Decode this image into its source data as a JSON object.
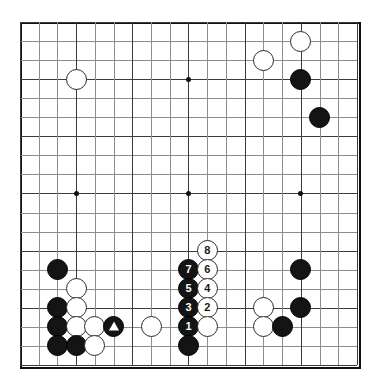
{
  "diagram": {
    "type": "go-board-diagram",
    "board_size": 19,
    "board": {
      "origin_x": 20,
      "origin_y": 22,
      "cell_w": 18.72,
      "cell_h": 19.05,
      "line_color": "#8d8d8d",
      "border_color": "#111111",
      "background_color": "#ffffff"
    },
    "star_points": [
      {
        "col": 3,
        "row": 3
      },
      {
        "col": 9,
        "row": 3
      },
      {
        "col": 15,
        "row": 3
      },
      {
        "col": 3,
        "row": 9
      },
      {
        "col": 9,
        "row": 9
      },
      {
        "col": 15,
        "row": 9
      },
      {
        "col": 3,
        "row": 15
      },
      {
        "col": 9,
        "row": 15
      },
      {
        "col": 15,
        "row": 15
      }
    ],
    "stones": [
      {
        "id": "w-c3-r1",
        "color": "white",
        "col": 3,
        "row": 3,
        "label": "",
        "marker": "none"
      },
      {
        "id": "w-c15-r1",
        "color": "white",
        "col": 15,
        "row": 1,
        "label": "",
        "marker": "none"
      },
      {
        "id": "w-c13-r2",
        "color": "white",
        "col": 13,
        "row": 2,
        "label": "",
        "marker": "none"
      },
      {
        "id": "b-c15-r3",
        "color": "black",
        "col": 15,
        "row": 3,
        "label": "",
        "marker": "none"
      },
      {
        "id": "b-c16-r5",
        "color": "black",
        "col": 16,
        "row": 5,
        "label": "",
        "marker": "none"
      },
      {
        "id": "w-8",
        "color": "white",
        "col": 10,
        "row": 12,
        "label": "8",
        "marker": "number"
      },
      {
        "id": "b-7",
        "color": "black",
        "col": 9,
        "row": 13,
        "label": "7",
        "marker": "number"
      },
      {
        "id": "w-6",
        "color": "white",
        "col": 10,
        "row": 13,
        "label": "6",
        "marker": "number"
      },
      {
        "id": "b-5",
        "color": "black",
        "col": 9,
        "row": 14,
        "label": "5",
        "marker": "number"
      },
      {
        "id": "w-4",
        "color": "white",
        "col": 10,
        "row": 14,
        "label": "4",
        "marker": "number"
      },
      {
        "id": "b-3",
        "color": "black",
        "col": 9,
        "row": 15,
        "label": "3",
        "marker": "number"
      },
      {
        "id": "w-2",
        "color": "white",
        "col": 10,
        "row": 15,
        "label": "2",
        "marker": "number"
      },
      {
        "id": "b-1",
        "color": "black",
        "col": 9,
        "row": 16,
        "label": "1",
        "marker": "number"
      },
      {
        "id": "w-c10-r16",
        "color": "white",
        "col": 10,
        "row": 16,
        "label": "",
        "marker": "none"
      },
      {
        "id": "b-c9-r17",
        "color": "black",
        "col": 9,
        "row": 17,
        "label": "",
        "marker": "none"
      },
      {
        "id": "b-c2-r13",
        "color": "black",
        "col": 2,
        "row": 13,
        "label": "",
        "marker": "none"
      },
      {
        "id": "w-c3-r14",
        "color": "white",
        "col": 3,
        "row": 14,
        "label": "",
        "marker": "none"
      },
      {
        "id": "b-c2-r15",
        "color": "black",
        "col": 2,
        "row": 15,
        "label": "",
        "marker": "none"
      },
      {
        "id": "w-c3-r15",
        "color": "white",
        "col": 3,
        "row": 15,
        "label": "",
        "marker": "none"
      },
      {
        "id": "b-c2-r16",
        "color": "black",
        "col": 2,
        "row": 16,
        "label": "",
        "marker": "none"
      },
      {
        "id": "w-c3-r16",
        "color": "white",
        "col": 3,
        "row": 16,
        "label": "",
        "marker": "none"
      },
      {
        "id": "w-c4-r16",
        "color": "white",
        "col": 4,
        "row": 16,
        "label": "",
        "marker": "none"
      },
      {
        "id": "b-tri",
        "color": "black",
        "col": 5,
        "row": 16,
        "label": "",
        "marker": "triangle"
      },
      {
        "id": "w-c7-r16",
        "color": "white",
        "col": 7,
        "row": 16,
        "label": "",
        "marker": "none"
      },
      {
        "id": "b-c2-r17",
        "color": "black",
        "col": 2,
        "row": 17,
        "label": "",
        "marker": "none"
      },
      {
        "id": "b-c3-r17",
        "color": "black",
        "col": 3,
        "row": 17,
        "label": "",
        "marker": "none"
      },
      {
        "id": "w-c4-r17",
        "color": "white",
        "col": 4,
        "row": 17,
        "label": "",
        "marker": "none"
      },
      {
        "id": "b-c15-r13",
        "color": "black",
        "col": 15,
        "row": 13,
        "label": "",
        "marker": "none"
      },
      {
        "id": "w-c13-r15",
        "color": "white",
        "col": 13,
        "row": 15,
        "label": "",
        "marker": "none"
      },
      {
        "id": "b-c15-r15",
        "color": "black",
        "col": 15,
        "row": 15,
        "label": "",
        "marker": "none"
      },
      {
        "id": "w-c13-r16",
        "color": "white",
        "col": 13,
        "row": 16,
        "label": "",
        "marker": "none"
      },
      {
        "id": "b-c14-r16",
        "color": "black",
        "col": 14,
        "row": 16,
        "label": "",
        "marker": "none"
      }
    ],
    "move_numbers": [
      "1",
      "2",
      "3",
      "4",
      "5",
      "6",
      "7",
      "8"
    ],
    "markers": {
      "triangle_label": "triangle"
    }
  }
}
